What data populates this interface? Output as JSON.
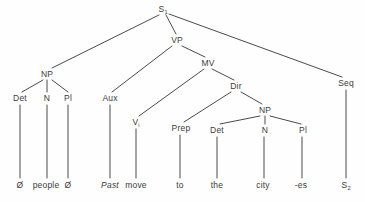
{
  "figure": {
    "type": "syntax-tree-diagram",
    "background_color": "#fefefe",
    "line_color": "#4a4a4a",
    "text_color": "#3b3b3b"
  },
  "nodes": [
    {
      "id": "S1",
      "label": "S",
      "sub": "1",
      "x": 163,
      "y": 9,
      "kind": "root"
    },
    {
      "id": "NP1",
      "label": "NP",
      "sub": "",
      "x": 47,
      "y": 74,
      "kind": "phrase"
    },
    {
      "id": "VP",
      "label": "VP",
      "sub": "",
      "x": 177,
      "y": 40,
      "kind": "phrase"
    },
    {
      "id": "Seq",
      "label": "Seq",
      "sub": "",
      "x": 346,
      "y": 83,
      "kind": "phrase"
    },
    {
      "id": "Det1",
      "label": "Det",
      "sub": "",
      "x": 20,
      "y": 98,
      "kind": "category"
    },
    {
      "id": "N1",
      "label": "N",
      "sub": "",
      "x": 47,
      "y": 98,
      "kind": "category"
    },
    {
      "id": "Pl1",
      "label": "Pl",
      "sub": "",
      "x": 68,
      "y": 98,
      "kind": "category"
    },
    {
      "id": "Aux",
      "label": "Aux",
      "sub": "",
      "x": 110,
      "y": 98,
      "kind": "category"
    },
    {
      "id": "MV",
      "label": "MV",
      "sub": "",
      "x": 208,
      "y": 63,
      "kind": "phrase"
    },
    {
      "id": "Vi",
      "label": "V",
      "sub": "i",
      "x": 136,
      "y": 122,
      "kind": "category"
    },
    {
      "id": "Dir",
      "label": "Dir",
      "sub": "",
      "x": 236,
      "y": 86,
      "kind": "phrase"
    },
    {
      "id": "Prep",
      "label": "Prep",
      "sub": "",
      "x": 181,
      "y": 128,
      "kind": "category"
    },
    {
      "id": "NP2",
      "label": "NP",
      "sub": "",
      "x": 265,
      "y": 110,
      "kind": "phrase"
    },
    {
      "id": "Det2",
      "label": "Det",
      "sub": "",
      "x": 217,
      "y": 130,
      "kind": "category"
    },
    {
      "id": "N2",
      "label": "N",
      "sub": "",
      "x": 265,
      "y": 130,
      "kind": "category"
    },
    {
      "id": "Pl2",
      "label": "Pl",
      "sub": "",
      "x": 303,
      "y": 130,
      "kind": "category"
    }
  ],
  "leaves": [
    {
      "id": "leaf-null-1",
      "label": "Ø",
      "sub": "",
      "x": 20,
      "y": 185,
      "italic": false
    },
    {
      "id": "leaf-people",
      "label": "people",
      "sub": "",
      "x": 46,
      "y": 185,
      "italic": false
    },
    {
      "id": "leaf-null-2",
      "label": "Ø",
      "sub": "",
      "x": 68,
      "y": 185,
      "italic": false
    },
    {
      "id": "leaf-past",
      "label": "Past",
      "sub": "",
      "x": 110,
      "y": 185,
      "italic": true
    },
    {
      "id": "leaf-move",
      "label": "move",
      "sub": "",
      "x": 136,
      "y": 185,
      "italic": false
    },
    {
      "id": "leaf-to",
      "label": "to",
      "sub": "",
      "x": 180,
      "y": 185,
      "italic": false
    },
    {
      "id": "leaf-the",
      "label": "the",
      "sub": "",
      "x": 217,
      "y": 185,
      "italic": false
    },
    {
      "id": "leaf-city",
      "label": "city",
      "sub": "",
      "x": 263,
      "y": 185,
      "italic": false
    },
    {
      "id": "leaf-es",
      "label": "-es",
      "sub": "",
      "x": 301,
      "y": 185,
      "italic": false
    },
    {
      "id": "leaf-S2",
      "label": "S",
      "sub": "2",
      "x": 346,
      "y": 185,
      "italic": false
    }
  ],
  "edges": [
    {
      "from": "S1",
      "to": "NP1",
      "x1": 159,
      "y1": 15,
      "x2": 52,
      "y2": 68
    },
    {
      "from": "S1",
      "to": "VP",
      "x1": 166,
      "y1": 15,
      "x2": 176,
      "y2": 34
    },
    {
      "from": "S1",
      "to": "Seq",
      "x1": 169,
      "y1": 14,
      "x2": 342,
      "y2": 77
    },
    {
      "from": "NP1",
      "to": "Det1",
      "x1": 43,
      "y1": 80,
      "x2": 22,
      "y2": 92
    },
    {
      "from": "NP1",
      "to": "N1",
      "x1": 47,
      "y1": 80,
      "x2": 47,
      "y2": 92
    },
    {
      "from": "NP1",
      "to": "Pl1",
      "x1": 52,
      "y1": 80,
      "x2": 68,
      "y2": 92
    },
    {
      "from": "VP",
      "to": "Aux",
      "x1": 172,
      "y1": 46,
      "x2": 112,
      "y2": 92
    },
    {
      "from": "VP",
      "to": "MV",
      "x1": 182,
      "y1": 46,
      "x2": 205,
      "y2": 57
    },
    {
      "from": "MV",
      "to": "Vi",
      "x1": 204,
      "y1": 69,
      "x2": 139,
      "y2": 116
    },
    {
      "from": "MV",
      "to": "Dir",
      "x1": 212,
      "y1": 69,
      "x2": 234,
      "y2": 80
    },
    {
      "from": "Dir",
      "to": "Prep",
      "x1": 231,
      "y1": 92,
      "x2": 184,
      "y2": 122
    },
    {
      "from": "Dir",
      "to": "NP2",
      "x1": 241,
      "y1": 92,
      "x2": 262,
      "y2": 104
    },
    {
      "from": "NP2",
      "to": "Det2",
      "x1": 260,
      "y1": 116,
      "x2": 220,
      "y2": 124
    },
    {
      "from": "NP2",
      "to": "N2",
      "x1": 265,
      "y1": 116,
      "x2": 265,
      "y2": 124
    },
    {
      "from": "NP2",
      "to": "Pl2",
      "x1": 270,
      "y1": 116,
      "x2": 301,
      "y2": 124
    },
    {
      "from": "Det1",
      "to": "leaf-null-1",
      "x1": 20,
      "y1": 105,
      "x2": 20,
      "y2": 178
    },
    {
      "from": "N1",
      "to": "leaf-people",
      "x1": 47,
      "y1": 105,
      "x2": 47,
      "y2": 178
    },
    {
      "from": "Pl1",
      "to": "leaf-null-2",
      "x1": 68,
      "y1": 105,
      "x2": 68,
      "y2": 178
    },
    {
      "from": "Aux",
      "to": "leaf-past",
      "x1": 110,
      "y1": 105,
      "x2": 110,
      "y2": 178
    },
    {
      "from": "Vi",
      "to": "leaf-move",
      "x1": 136,
      "y1": 129,
      "x2": 136,
      "y2": 178
    },
    {
      "from": "Prep",
      "to": "leaf-to",
      "x1": 180,
      "y1": 135,
      "x2": 180,
      "y2": 178
    },
    {
      "from": "Det2",
      "to": "leaf-the",
      "x1": 217,
      "y1": 137,
      "x2": 217,
      "y2": 178
    },
    {
      "from": "N2",
      "to": "leaf-city",
      "x1": 264,
      "y1": 137,
      "x2": 264,
      "y2": 178
    },
    {
      "from": "Pl2",
      "to": "leaf-es",
      "x1": 302,
      "y1": 137,
      "x2": 302,
      "y2": 178
    },
    {
      "from": "Seq",
      "to": "leaf-S2",
      "x1": 346,
      "y1": 90,
      "x2": 346,
      "y2": 178
    }
  ]
}
